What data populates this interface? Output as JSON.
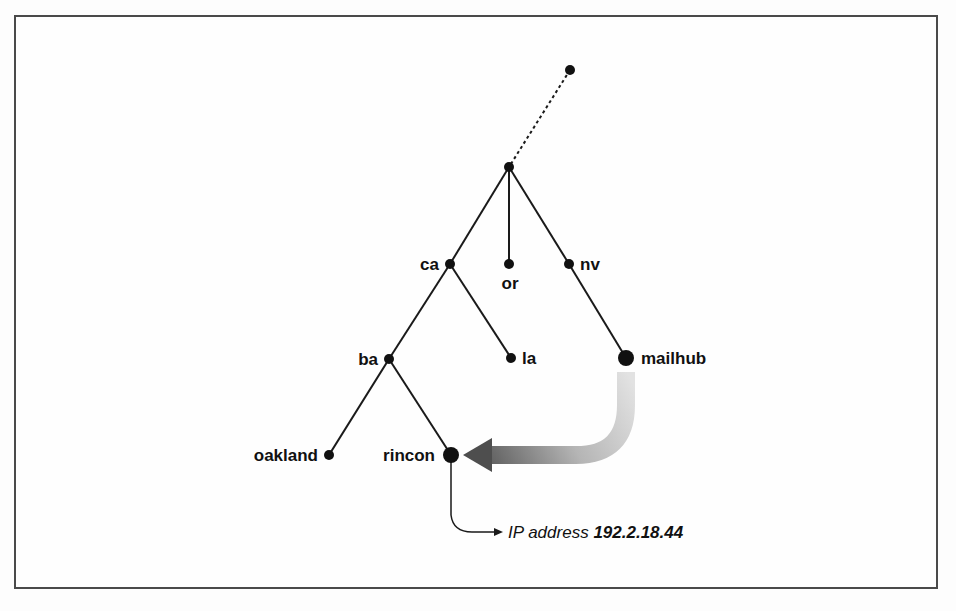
{
  "diagram": {
    "type": "dns-tree",
    "nodes": {
      "top": {
        "label": ""
      },
      "root": {
        "label": ""
      },
      "ca": {
        "label": "ca"
      },
      "or": {
        "label": "or"
      },
      "nv": {
        "label": "nv"
      },
      "ba": {
        "label": "ba"
      },
      "la": {
        "label": "la"
      },
      "mailhub": {
        "label": "mailhub"
      },
      "oakland": {
        "label": "oakland"
      },
      "rincon": {
        "label": "rincon"
      }
    },
    "edges": [
      {
        "from": "top",
        "to": "root",
        "style": "dotted"
      },
      {
        "from": "root",
        "to": "ca",
        "style": "solid"
      },
      {
        "from": "root",
        "to": "or",
        "style": "solid"
      },
      {
        "from": "root",
        "to": "nv",
        "style": "solid"
      },
      {
        "from": "ca",
        "to": "ba",
        "style": "solid"
      },
      {
        "from": "ca",
        "to": "la",
        "style": "solid"
      },
      {
        "from": "nv",
        "to": "mailhub",
        "style": "solid"
      },
      {
        "from": "ba",
        "to": "oakland",
        "style": "solid"
      },
      {
        "from": "ba",
        "to": "rincon",
        "style": "solid"
      }
    ],
    "referral_arrow": {
      "from": "mailhub",
      "to": "rincon",
      "style": "gradient-thick"
    },
    "result": {
      "prefix": "IP address",
      "address": "192.2.18.44"
    },
    "colors": {
      "line": "#1a1a1a",
      "arrow_light": "#d8d8d8",
      "arrow_dark": "#5a5a5a",
      "frame": "#4a4a4a"
    }
  }
}
